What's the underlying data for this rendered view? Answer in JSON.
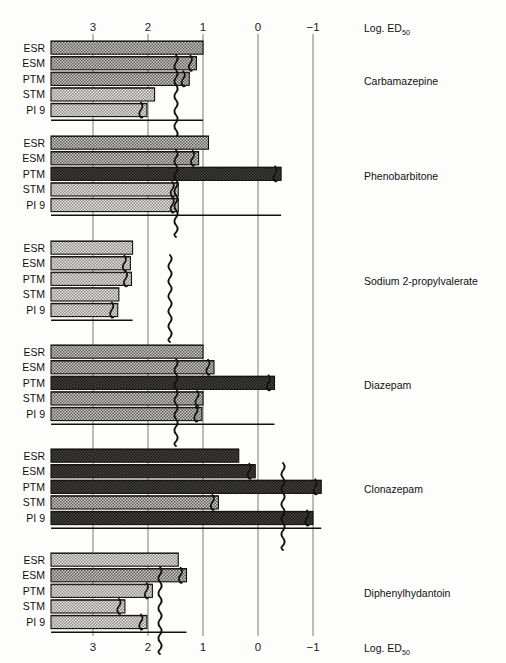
{
  "figure": {
    "axis_title_top": "Log. ED",
    "axis_title_top_sub": "50",
    "axis_title_bottom": "Log. ED",
    "axis_title_bottom_sub": "50"
  },
  "chart_data": {
    "type": "bar",
    "orientation": "horizontal",
    "title": "",
    "xlabel": "Log. ED50",
    "ylabel": "",
    "xlim": [
      3.45,
      -1.25
    ],
    "axis_reversed": true,
    "grid": true,
    "tick_labels": [
      "3",
      "2",
      "1",
      "0",
      "−1"
    ],
    "tick_values": [
      3,
      2,
      1,
      0,
      -1
    ],
    "categories": [
      "ESR",
      "ESM",
      "PTM",
      "STM",
      "PI 9"
    ],
    "groups": [
      {
        "name": "Carbamazepine",
        "values": [
          1.0,
          1.12,
          1.25,
          1.88,
          2.02
        ],
        "break_marks": [
          false,
          true,
          true,
          false,
          true
        ]
      },
      {
        "name": "Phenobarbitone",
        "values": [
          0.9,
          1.08,
          -0.42,
          1.45,
          1.45
        ],
        "break_marks": [
          false,
          true,
          true,
          true,
          true
        ]
      },
      {
        "name": "Sodium 2-propylvalerate",
        "values": [
          2.28,
          2.32,
          2.3,
          2.53,
          2.55
        ],
        "break_marks": [
          false,
          true,
          true,
          false,
          true
        ]
      },
      {
        "name": "Diazepam",
        "values": [
          1.0,
          0.8,
          -0.3,
          1.0,
          1.02
        ],
        "break_marks": [
          false,
          true,
          true,
          true,
          true
        ]
      },
      {
        "name": "Clonazepam",
        "values": [
          0.35,
          0.05,
          -1.15,
          0.72,
          -1.0
        ],
        "break_marks": [
          false,
          true,
          true,
          true,
          true
        ]
      },
      {
        "name": "Diphenylhydantoin",
        "values": [
          1.45,
          1.3,
          1.92,
          2.42,
          2.02
        ],
        "break_marks": [
          false,
          true,
          true,
          true,
          true
        ]
      }
    ]
  },
  "row_labels": [
    "ESR",
    "ESM",
    "PTM",
    "STM",
    "PI 9"
  ],
  "colors": {
    "background": "#fdfdfb",
    "bar_light": "#b9b6b0",
    "bar_mid": "#8f8c86",
    "bar_dark": "#3b3936",
    "axis": "#6b6b6b",
    "text": "#1a1a1a"
  }
}
